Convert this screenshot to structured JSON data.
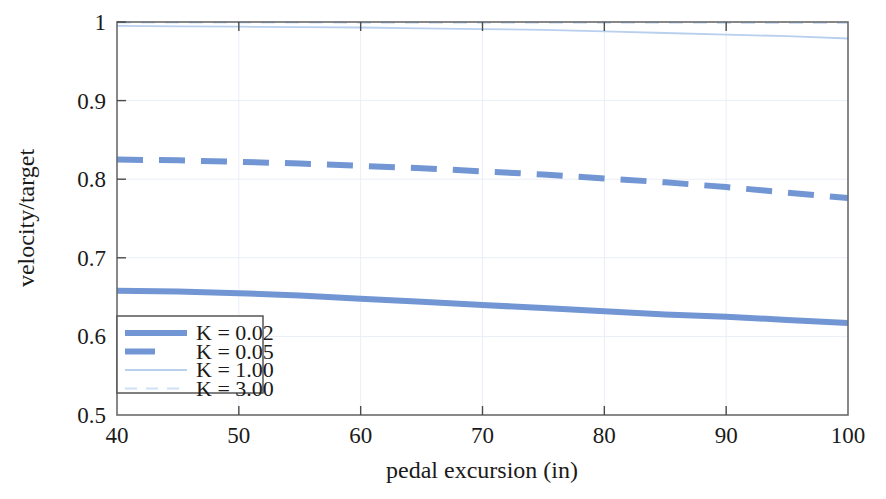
{
  "chart_data": {
    "type": "line",
    "title": "",
    "xlabel": "pedal excursion (in)",
    "ylabel": "velocity/target",
    "xlim": [
      40,
      100
    ],
    "ylim": [
      0.5,
      1.0
    ],
    "xticks": [
      40,
      50,
      60,
      70,
      80,
      90,
      100
    ],
    "xtick_labels": [
      "40",
      "50",
      "60",
      "70",
      "80",
      "90",
      "100"
    ],
    "yticks": [
      0.5,
      0.6,
      0.7,
      0.8,
      0.9,
      1.0
    ],
    "ytick_labels": [
      "0.5",
      "0.6",
      "0.7",
      "0.8",
      "0.9",
      "1"
    ],
    "grid": true,
    "legend_position": "lower left",
    "x": [
      40,
      45,
      50,
      55,
      60,
      65,
      70,
      75,
      80,
      85,
      90,
      95,
      100
    ],
    "series": [
      {
        "name": "K = 0.02",
        "label": "K = 0.02",
        "style": "solid",
        "width": 6,
        "color": "#7296d4",
        "values": [
          0.658,
          0.657,
          0.655,
          0.652,
          0.648,
          0.644,
          0.64,
          0.636,
          0.632,
          0.628,
          0.625,
          0.621,
          0.617
        ]
      },
      {
        "name": "K = 0.05",
        "label": "K = 0.05",
        "style": "dashed",
        "width": 6,
        "color": "#7296d4",
        "values": [
          0.825,
          0.824,
          0.822,
          0.82,
          0.817,
          0.814,
          0.81,
          0.806,
          0.801,
          0.796,
          0.79,
          0.783,
          0.776
        ]
      },
      {
        "name": "K = 1.00",
        "label": "K = 1.00",
        "style": "solid",
        "width": 1.8,
        "color": "#b8d0ee",
        "values": [
          0.995,
          0.9945,
          0.994,
          0.9935,
          0.993,
          0.992,
          0.991,
          0.99,
          0.988,
          0.986,
          0.984,
          0.982,
          0.979
        ]
      },
      {
        "name": "K = 3.00",
        "label": "K = 3.00",
        "style": "dashed",
        "width": 2.2,
        "color": "#cfe0f5",
        "values": [
          0.9995,
          0.9995,
          0.9994,
          0.9994,
          0.9993,
          0.9993,
          0.9992,
          0.9992,
          0.9991,
          0.9991,
          0.999,
          0.999,
          0.9989
        ]
      }
    ]
  },
  "axes": {
    "ylabel": "velocity/target",
    "xlabel": "pedal excursion (in)",
    "xtick_labels": [
      "40",
      "50",
      "60",
      "70",
      "80",
      "90",
      "100"
    ],
    "ytick_labels": [
      "1",
      "0.9",
      "0.8",
      "0.7",
      "0.6",
      "0.5"
    ]
  },
  "legend": {
    "entries": [
      {
        "label": "K = 0.02"
      },
      {
        "label": "K = 0.05"
      },
      {
        "label": "K = 1.00"
      },
      {
        "label": "K = 3.00"
      }
    ]
  },
  "colors": {
    "primary_blue": "#7296d4",
    "light_blue": "#b8d0ee",
    "pale_blue": "#cfe0f5",
    "axis_gray": "#6b6b6b",
    "grid": "#e9eef6",
    "text": "#1a1a1a",
    "background": "#ffffff"
  }
}
